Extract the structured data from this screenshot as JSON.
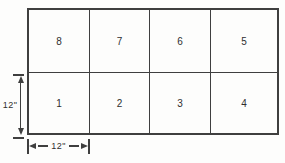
{
  "grid": {
    "rows": 2,
    "columns": 4,
    "cells": [
      {
        "label": "8"
      },
      {
        "label": "7"
      },
      {
        "label": "6"
      },
      {
        "label": "5"
      },
      {
        "label": "1"
      },
      {
        "label": "2"
      },
      {
        "label": "3"
      },
      {
        "label": "4"
      }
    ]
  },
  "dimensions": {
    "left": {
      "label": "12\"",
      "orientation": "vertical"
    },
    "bottom": {
      "label": "12\"",
      "orientation": "horizontal"
    }
  },
  "colors": {
    "line": "#3f3f3f",
    "background": "#fdfdfc",
    "text": "#2f2f2f"
  }
}
